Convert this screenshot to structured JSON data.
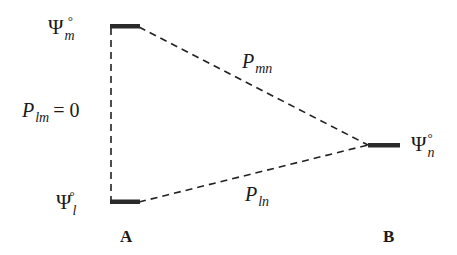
{
  "figure": {
    "type": "three-level state diagram",
    "colors": {
      "line": "#222222",
      "level": "#2a2a2a",
      "text": "#1a1a1a",
      "background": "#ffffff"
    }
  },
  "levels": [
    {
      "id": "m",
      "symbol": "Ψ",
      "subscript": "m",
      "superscript": "°",
      "site": "A",
      "position": "top-left"
    },
    {
      "id": "l",
      "symbol": "Ψ",
      "subscript": "l",
      "superscript": "°",
      "site": "A",
      "position": "bottom-left"
    },
    {
      "id": "n",
      "symbol": "Ψ",
      "subscript": "n",
      "superscript": "°",
      "site": "B",
      "position": "right"
    }
  ],
  "transitions": [
    {
      "from": "l",
      "to": "m",
      "symbol": "P",
      "subscript": "lm",
      "value": "= 0"
    },
    {
      "from": "m",
      "to": "n",
      "symbol": "P",
      "subscript": "mn"
    },
    {
      "from": "l",
      "to": "n",
      "symbol": "P",
      "subscript": "ln"
    }
  ],
  "sites": [
    {
      "label": "A"
    },
    {
      "label": "B"
    }
  ]
}
